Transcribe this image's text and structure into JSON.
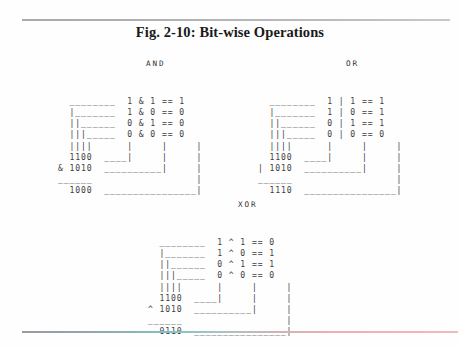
{
  "figure": {
    "title": "Fig. 2-10: Bit-wise Operations"
  },
  "blocks": [
    {
      "label": "AND",
      "operator_symbol": "&",
      "operand_a": "1100",
      "operand_b": "1010",
      "result": "1000",
      "truth_table": [
        {
          "a": "1",
          "op": "&",
          "b": "1",
          "eq": "==",
          "out": "1"
        },
        {
          "a": "1",
          "op": "&",
          "b": "0",
          "eq": "==",
          "out": "0"
        },
        {
          "a": "0",
          "op": "&",
          "b": "1",
          "eq": "==",
          "out": "0"
        },
        {
          "a": "0",
          "op": "&",
          "b": "0",
          "eq": "==",
          "out": "0"
        }
      ],
      "art": "  ________  1 & 1 == 1\n  |_______  1 & 0 == 0\n  ||______  0 & 1 == 0\n  |||_____  0 & 0 == 0\n  ||||      |     |     |\n  1100  ____|     |     |\n& 1010  __________|     |\n______                  |\n  1000  ________________|"
    },
    {
      "label": "OR",
      "operator_symbol": "|",
      "operand_a": "1100",
      "operand_b": "1010",
      "result": "1110",
      "truth_table": [
        {
          "a": "1",
          "op": "|",
          "b": "1",
          "eq": "==",
          "out": "1"
        },
        {
          "a": "1",
          "op": "|",
          "b": "0",
          "eq": "==",
          "out": "1"
        },
        {
          "a": "0",
          "op": "|",
          "b": "1",
          "eq": "==",
          "out": "1"
        },
        {
          "a": "0",
          "op": "|",
          "b": "0",
          "eq": "==",
          "out": "0"
        }
      ],
      "art": "  ________  1 | 1 == 1\n  |_______  1 | 0 == 1\n  ||______  0 | 1 == 1\n  |||_____  0 | 0 == 0\n  ||||      |     |     |\n  1100  ____|     |     |\n| 1010  __________|     |\n______                  |\n  1110  ________________|"
    },
    {
      "label": "XOR",
      "operator_symbol": "^",
      "operand_a": "1100",
      "operand_b": "1010",
      "result": "0110",
      "truth_table": [
        {
          "a": "1",
          "op": "^",
          "b": "1",
          "eq": "==",
          "out": "0"
        },
        {
          "a": "1",
          "op": "^",
          "b": "0",
          "eq": "==",
          "out": "1"
        },
        {
          "a": "0",
          "op": "^",
          "b": "1",
          "eq": "==",
          "out": "1"
        },
        {
          "a": "0",
          "op": "^",
          "b": "0",
          "eq": "==",
          "out": "0"
        }
      ],
      "art": "  ________  1 ^ 1 == 0\n  |_______  1 ^ 0 == 1\n  ||______  0 ^ 1 == 1\n  |||_____  0 ^ 0 == 0\n  ||||      |     |     |\n  1100  ____|     |     |\n^ 1010  __________|     |\n______                  |\n  0110  ________________|"
    }
  ]
}
